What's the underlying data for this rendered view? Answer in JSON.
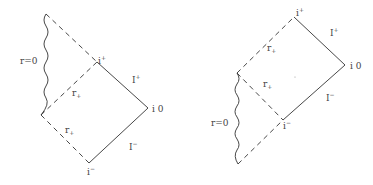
{
  "figure": {
    "colors": {
      "line": "#333333",
      "text": "#444444",
      "background": "#ffffff"
    }
  },
  "left_diagram": {
    "labels": {
      "singularity": "r=0",
      "i_plus": "i",
      "i_plus_sup": "+",
      "scri_plus": "I",
      "scri_plus_sup": "+",
      "i_zero": "i 0",
      "scri_minus": "I",
      "scri_minus_sup": "−",
      "i_minus": "i",
      "i_minus_sup": "−",
      "horizon_upper": "r",
      "horizon_upper_sub": "+",
      "horizon_lower": "r",
      "horizon_lower_sub": "+"
    }
  },
  "right_diagram": {
    "labels": {
      "singularity": "r=0",
      "i_plus": "i",
      "i_plus_sup": "+",
      "scri_plus": "I",
      "scri_plus_sup": "+",
      "i_zero": "i 0",
      "scri_minus": "I",
      "scri_minus_sup": "−",
      "i_minus": "i",
      "i_minus_sup": "−",
      "horizon_upper": "r",
      "horizon_upper_sub": "+",
      "horizon_lower": "r",
      "horizon_lower_sub": "+"
    }
  }
}
